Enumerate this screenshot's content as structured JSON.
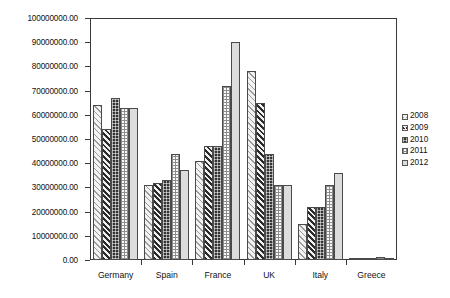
{
  "chart_data": {
    "type": "bar",
    "title": "",
    "xlabel": "",
    "ylabel": "",
    "ylim": [
      0,
      100000000
    ],
    "grid": false,
    "legend_position": "right",
    "categories": [
      "Germany",
      "Spain",
      "France",
      "UK",
      "Italy",
      "Greece"
    ],
    "y_tick_labels": [
      "100000000.00",
      "90000000.00",
      "80000000.00",
      "70000000.00",
      "60000000.00",
      "50000000.00",
      "40000000.00",
      "30000000.00",
      "20000000.00",
      "10000000.00",
      "0.00"
    ],
    "y_tick_values": [
      100000000,
      90000000,
      80000000,
      70000000,
      60000000,
      50000000,
      40000000,
      30000000,
      20000000,
      10000000,
      0
    ],
    "series": [
      {
        "name": "2008",
        "pattern": "light-diagonal-hatch",
        "values": [
          64000000,
          31000000,
          41000000,
          78000000,
          15000000,
          800000
        ]
      },
      {
        "name": "2009",
        "pattern": "dark-diagonal-hatch",
        "values": [
          54000000,
          32000000,
          47000000,
          65000000,
          22000000,
          900000
        ]
      },
      {
        "name": "2010",
        "pattern": "dark-checker",
        "values": [
          67000000,
          33000000,
          47000000,
          44000000,
          22000000,
          1000000
        ]
      },
      {
        "name": "2011",
        "pattern": "light-grid-dots",
        "values": [
          63000000,
          44000000,
          72000000,
          31000000,
          31000000,
          1200000
        ]
      },
      {
        "name": "2012",
        "pattern": "solid-light-gray",
        "values": [
          63000000,
          37000000,
          90000000,
          31000000,
          36000000,
          1000000
        ]
      }
    ]
  },
  "legend": {
    "entries": [
      "2008",
      "2009",
      "2010",
      "2011",
      "2012"
    ]
  },
  "colors": {
    "axis": "#3a3a3a",
    "text": "#111111",
    "series_2008": "#f2f2f2",
    "series_2009": "#e8e8e8",
    "series_2010": "#333333",
    "series_2011": "#fafafa",
    "series_2012": "#dcdcdc"
  }
}
